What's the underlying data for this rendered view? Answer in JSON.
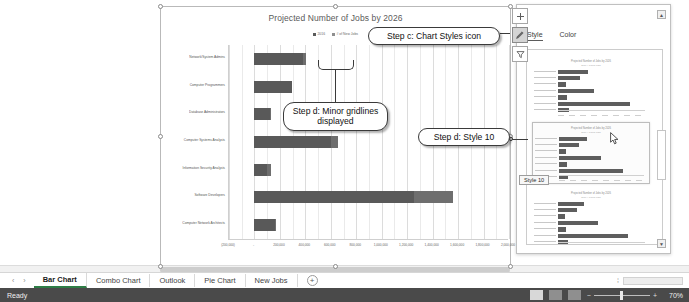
{
  "app": {
    "status_text": "Ready",
    "zoom_value": "70%"
  },
  "chart": {
    "title": "Projected Number of Jobs by 2026",
    "legend": [
      {
        "label": "2016",
        "color": "#5b5b5b"
      },
      {
        "label": "# of New Jobs",
        "color": "#8f8f8f"
      }
    ],
    "axis_ticks": [
      "(200,000)",
      "-",
      "200,000",
      "400,000",
      "600,000",
      "800,000",
      "1,000,000",
      "1,200,000",
      "1,400,000",
      "1,600,000",
      "1,800,000",
      "2,000,000"
    ]
  },
  "chart_data": {
    "type": "bar",
    "orientation": "horizontal",
    "title": "Projected Number of Jobs by 2026",
    "xlabel": "",
    "ylabel": "",
    "xlim": [
      -200000,
      2000000
    ],
    "grid": true,
    "minor_gridlines": true,
    "legend_position": "top",
    "categories": [
      "Network/System Admins",
      "Computer Programmers",
      "Database Administrators",
      "Computer Systems Analysts",
      "Information Security Analysts",
      "Software Developers",
      "Computer Network Architects"
    ],
    "series": [
      {
        "name": "2016",
        "color": "#595959",
        "values": [
          383900,
          294900,
          119500,
          600500,
          100000,
          1256200,
          162700
        ]
      },
      {
        "name": "# of New Jobs",
        "color": "#6e6e6e",
        "values": [
          24000,
          0,
          13700,
          54400,
          28500,
          302500,
          10500
        ]
      }
    ]
  },
  "chart_buttons": [
    {
      "name": "chart-elements",
      "glyph": "+"
    },
    {
      "name": "chart-styles",
      "glyph": "✎"
    },
    {
      "name": "chart-filters",
      "glyph": "▽"
    }
  ],
  "styles_pane": {
    "tabs": [
      {
        "label": "Style",
        "active": true
      },
      {
        "label": "Color",
        "active": false
      }
    ],
    "tooltip": "Style 10",
    "scroll_up": "▲",
    "scroll_down": "▼",
    "thumbnails": [
      {
        "name": "style-thumb-9",
        "title": "Projected Number of Jobs by 2026",
        "subtitle": "2016   # of New Jobs",
        "bars": [
          30,
          22,
          8,
          36,
          9,
          72,
          11
        ],
        "selected": false
      },
      {
        "name": "style-thumb-10",
        "title": "Projected Number of Jobs by 2026",
        "subtitle": "2016   # of New Jobs",
        "bars": [
          28,
          20,
          7,
          42,
          8,
          64,
          9
        ],
        "selected": true
      },
      {
        "name": "style-thumb-11",
        "title": "Projected Number of Jobs by 2026",
        "subtitle": "2016   # of New Jobs",
        "bars": [
          26,
          19,
          7,
          40,
          8,
          70,
          10
        ],
        "selected": false
      }
    ]
  },
  "callouts": [
    {
      "name": "callout-chart-styles-icon",
      "text": "Step c: Chart Styles icon"
    },
    {
      "name": "callout-minor-gridlines",
      "text": "Step d: Minor gridlines displayed"
    },
    {
      "name": "callout-style-10",
      "text": "Step d: Style 10"
    }
  ],
  "sheet_tabs": [
    {
      "label": "Bar Chart",
      "active": true
    },
    {
      "label": "Combo Chart",
      "active": false
    },
    {
      "label": "Outlook",
      "active": false
    },
    {
      "label": "Pie Chart",
      "active": false
    },
    {
      "label": "New Jobs",
      "active": false
    }
  ],
  "tab_nav": {
    "prev": "‹",
    "next": "›",
    "add": "+"
  },
  "view_buttons": [
    {
      "name": "view-normal",
      "active": true
    },
    {
      "name": "view-page-layout",
      "active": false
    },
    {
      "name": "view-page-break",
      "active": false
    }
  ],
  "zoom_controls": {
    "minus": "−",
    "plus": "+"
  }
}
